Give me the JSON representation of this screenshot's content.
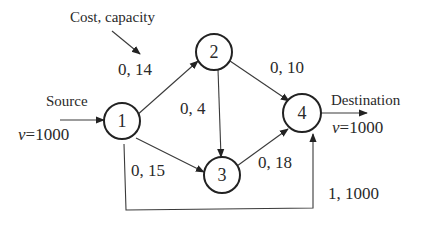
{
  "diagram": {
    "type": "network-flow-graph",
    "annotation": "Cost, capacity",
    "source": {
      "label": "Source",
      "flow": "v=1000",
      "flow_var": "v",
      "flow_value": "=1000"
    },
    "destination": {
      "label": "Destination",
      "flow": "v=1000",
      "flow_var": "v",
      "flow_value": "=1000"
    },
    "nodes": [
      {
        "id": "1",
        "label": "1"
      },
      {
        "id": "2",
        "label": "2"
      },
      {
        "id": "3",
        "label": "3"
      },
      {
        "id": "4",
        "label": "4"
      }
    ],
    "edges": [
      {
        "from": "1",
        "to": "2",
        "label": "0, 14",
        "cost": 0,
        "capacity": 14
      },
      {
        "from": "2",
        "to": "4",
        "label": "0, 10",
        "cost": 0,
        "capacity": 10
      },
      {
        "from": "2",
        "to": "3",
        "label": "0, 4",
        "cost": 0,
        "capacity": 4
      },
      {
        "from": "1",
        "to": "3",
        "label": "0, 15",
        "cost": 0,
        "capacity": 15
      },
      {
        "from": "3",
        "to": "4",
        "label": "0, 18",
        "cost": 0,
        "capacity": 18
      },
      {
        "from": "1",
        "to": "4",
        "label": "1, 1000",
        "cost": 1,
        "capacity": 1000
      }
    ]
  }
}
